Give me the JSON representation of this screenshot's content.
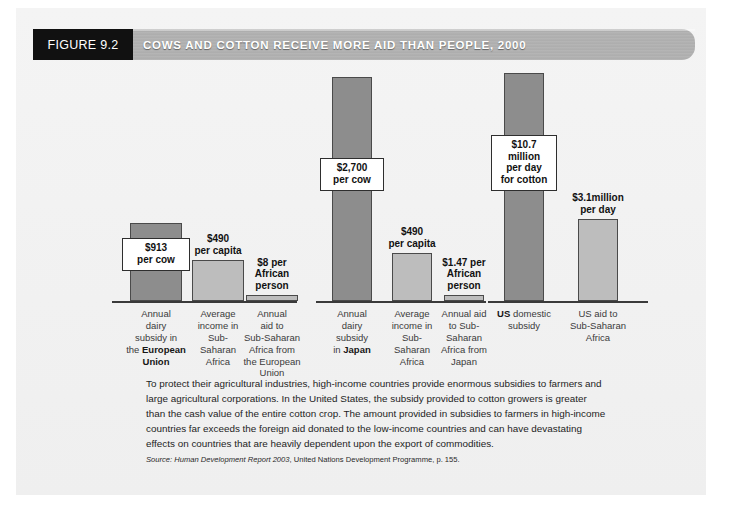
{
  "header": {
    "figure_tag": "FIGURE 9.2",
    "title": "COWS AND COTTON RECEIVE MORE AID THAN PEOPLE, 2000"
  },
  "chart_data": {
    "type": "bar",
    "title": "COWS AND COTTON RECEIVE MORE AID THAN PEOPLE, 2000",
    "xlabel": "",
    "ylabel": "",
    "grid": false,
    "legend": "none",
    "groups": [
      {
        "name": "European Union",
        "bars": [
          {
            "category": "Annual dairy subsidy in the European Union",
            "category_plain": "Annual\ndairy\nsubsidy in\nthe ",
            "category_bold": "European\nUnion",
            "value": 913,
            "unit": "USD per cow per year",
            "label": "$913\nper cow",
            "style": "dark",
            "label_kind": "callout"
          },
          {
            "category": "Average income in Sub-Saharan Africa",
            "category_plain": "Average\nincome in\nSub-\nSaharan\nAfrica",
            "value": 490,
            "unit": "USD per capita per year",
            "label": "$490\nper capita",
            "style": "light",
            "label_kind": "above"
          },
          {
            "category": "Annual aid to Sub-Saharan Africa from the European Union",
            "category_plain": "Annual\naid to\nSub-Saharan\nAfrica from\nthe European\nUnion",
            "value": 8,
            "unit": "USD per African person per year",
            "label": "$8 per\nAfrican\nperson",
            "style": "light",
            "label_kind": "above"
          }
        ]
      },
      {
        "name": "Japan",
        "bars": [
          {
            "category": "Annual dairy subsidy in Japan",
            "category_plain": "Annual\ndairy\nsubsidy\nin ",
            "category_bold": "Japan",
            "value": 2700,
            "unit": "USD per cow per year",
            "label": "$2,700\nper cow",
            "style": "dark",
            "label_kind": "callout"
          },
          {
            "category": "Average income in Sub-Saharan Africa",
            "category_plain": "Average\nincome in\nSub-\nSaharan\nAfrica",
            "value": 490,
            "unit": "USD per capita per year",
            "label": "$490\nper capita",
            "style": "light",
            "label_kind": "above"
          },
          {
            "category": "Annual aid to Sub-Saharan Africa from Japan",
            "category_plain": "Annual aid\nto Sub-\nSaharan\nAfrica from\nJapan",
            "value": 1.47,
            "unit": "USD per African person per year",
            "label": "$1.47 per\nAfrican\nperson",
            "style": "light",
            "label_kind": "above"
          }
        ]
      },
      {
        "name": "United States",
        "bars": [
          {
            "category": "US domestic subsidy",
            "category_plain": " domestic\nsubsidy",
            "category_bold": "US",
            "value": 10.7,
            "unit": "million USD per day for cotton",
            "label": "$10.7\nmillion\nper day\nfor cotton",
            "style": "dark",
            "label_kind": "callout"
          },
          {
            "category": "US aid to Sub-Saharan Africa",
            "category_plain": "US aid to\nSub-Saharan\nAfrica",
            "value": 3.1,
            "unit": "million USD per day",
            "label": "$3.1million\nper day",
            "style": "light",
            "label_kind": "above"
          }
        ]
      }
    ]
  },
  "body": {
    "paragraph": "To protect their agricultural industries, high-income countries provide enormous subsidies to farmers and large agricultural corporations. In the United States, the subsidy provided to cotton growers is greater than the cash value of the entire cotton crop. The amount provided in subsidies to farmers in high-income countries far exceeds the foreign aid donated to the low-income countries and can have devastating effects on countries that are heavily dependent upon the export of commodities.",
    "source_prefix": "Source: ",
    "source_italic": "Human Development Report 2003",
    "source_rest": ", United Nations Development Programme, p. 155."
  },
  "colors": {
    "bar_dark": "#8d8d8d",
    "bar_light": "#bdbdbd",
    "tag_background": "#111111",
    "panel_background": "#f2f2f2"
  }
}
